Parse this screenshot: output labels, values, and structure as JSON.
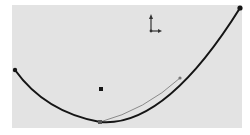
{
  "viewport": {
    "background": "#e3e3e3",
    "curve_color": "#151515",
    "handle_color": "#8a8a8a"
  },
  "sketch": {
    "spline": {
      "start": [
        15,
        70
      ],
      "vertex": [
        100,
        122
      ],
      "end": [
        240,
        8
      ]
    },
    "tangent_handle": {
      "from": [
        100,
        122
      ],
      "to": [
        180,
        78
      ]
    },
    "center_point": [
      101,
      89
    ],
    "origin": [
      151,
      30
    ]
  }
}
